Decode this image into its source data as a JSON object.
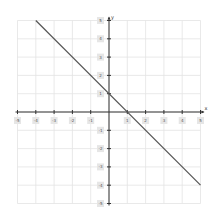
{
  "chart_data": {
    "type": "line",
    "title": "",
    "xlabel": "x",
    "ylabel": "y",
    "xlim": [
      -5,
      5
    ],
    "ylim": [
      -5,
      5
    ],
    "grid": true,
    "x_ticks": [
      -5,
      -4,
      -3,
      -2,
      -1,
      1,
      2,
      3,
      4,
      5
    ],
    "y_ticks": [
      5,
      4,
      3,
      2,
      1,
      -1,
      -2,
      -3,
      -4,
      -5
    ],
    "series": [
      {
        "name": "y = -x + 1",
        "x": [
          -4,
          5
        ],
        "y": [
          5,
          -4
        ],
        "color": "#555555"
      }
    ]
  },
  "colors": {
    "grid": "#e3e3e3",
    "axis": "#333333",
    "line": "#555555",
    "label_bg": "#e6e6e6"
  },
  "axis_labels": {
    "x": "x",
    "y": "y"
  }
}
